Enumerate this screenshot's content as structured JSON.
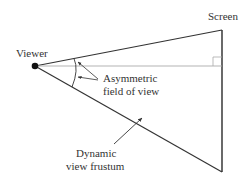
{
  "diagram": {
    "labels": {
      "screen": "Screen",
      "viewer": "Viewer",
      "asym_line1": "Asymmetric",
      "asym_line2": "field of view",
      "frustum_line1": "Dynamic",
      "frustum_line2": "view frustum"
    },
    "colors": {
      "stroke": "#333333",
      "centerline": "#999999",
      "text": "#333333"
    }
  }
}
